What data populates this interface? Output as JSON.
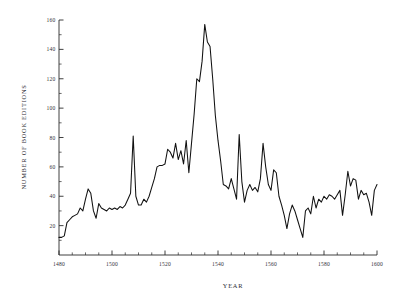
{
  "chart_data": {
    "type": "line",
    "title": "",
    "subtitle": "",
    "xlabel": "YEAR",
    "ylabel": "NUMBER OF BOOK EDITIONS",
    "xlim": [
      1480,
      1600
    ],
    "ylim": [
      0,
      160
    ],
    "grid": false,
    "legend": null,
    "x_ticks": [
      1480,
      1500,
      1520,
      1540,
      1560,
      1580,
      1600
    ],
    "x_tick_labels": [
      "1480",
      "1500",
      "1520",
      "1540",
      "1560",
      "1580",
      "1600"
    ],
    "x_minor_tick_interval": 5,
    "y_ticks": [
      20,
      40,
      60,
      80,
      100,
      120,
      140,
      160
    ],
    "y_tick_labels": [
      "20",
      "40",
      "60",
      "80",
      "100",
      "120",
      "140",
      "160"
    ],
    "y_minor_tick_interval": 10,
    "series": [
      {
        "name": "Book editions per year",
        "color": "#111111",
        "x": [
          1480,
          1481,
          1482,
          1483,
          1484,
          1485,
          1486,
          1487,
          1488,
          1489,
          1490,
          1491,
          1492,
          1493,
          1494,
          1495,
          1496,
          1497,
          1498,
          1499,
          1500,
          1501,
          1502,
          1503,
          1504,
          1505,
          1506,
          1507,
          1508,
          1509,
          1510,
          1511,
          1512,
          1513,
          1514,
          1515,
          1516,
          1517,
          1518,
          1519,
          1520,
          1521,
          1522,
          1523,
          1524,
          1525,
          1526,
          1527,
          1528,
          1529,
          1530,
          1531,
          1532,
          1533,
          1534,
          1535,
          1536,
          1537,
          1538,
          1539,
          1540,
          1541,
          1542,
          1543,
          1544,
          1545,
          1546,
          1547,
          1548,
          1549,
          1550,
          1551,
          1552,
          1553,
          1554,
          1555,
          1556,
          1557,
          1558,
          1559,
          1560,
          1561,
          1562,
          1563,
          1564,
          1565,
          1566,
          1567,
          1568,
          1569,
          1570,
          1571,
          1572,
          1573,
          1574,
          1575,
          1576,
          1577,
          1578,
          1579,
          1580,
          1581,
          1582,
          1583,
          1584,
          1585,
          1586,
          1587,
          1588,
          1589,
          1590,
          1591,
          1592,
          1593,
          1594,
          1595,
          1596,
          1597,
          1598,
          1599,
          1600
        ],
        "values": [
          12,
          12,
          13,
          22,
          24,
          26,
          27,
          28,
          32,
          30,
          38,
          45,
          42,
          30,
          25,
          35,
          32,
          31,
          30,
          32,
          31,
          32,
          31,
          33,
          32,
          34,
          38,
          42,
          81,
          40,
          34,
          34,
          38,
          36,
          40,
          46,
          52,
          60,
          61,
          61,
          62,
          72,
          70,
          66,
          76,
          65,
          71,
          62,
          78,
          56,
          76,
          96,
          120,
          118,
          132,
          157,
          145,
          142,
          120,
          95,
          78,
          64,
          48,
          47,
          45,
          52,
          45,
          38,
          82,
          50,
          36,
          44,
          48,
          44,
          46,
          43,
          52,
          76,
          60,
          48,
          44,
          58,
          56,
          40,
          34,
          27,
          18,
          28,
          34,
          30,
          24,
          18,
          12,
          30,
          32,
          28,
          40,
          32,
          38,
          36,
          40,
          38,
          41,
          40,
          38,
          41,
          44,
          27,
          41,
          57,
          47,
          52,
          51,
          38,
          44,
          41,
          42,
          36,
          27,
          44,
          48
        ]
      }
    ]
  },
  "axis_titles": {
    "x": "YEAR",
    "y": "NUMBER OF BOOK EDITIONS"
  }
}
